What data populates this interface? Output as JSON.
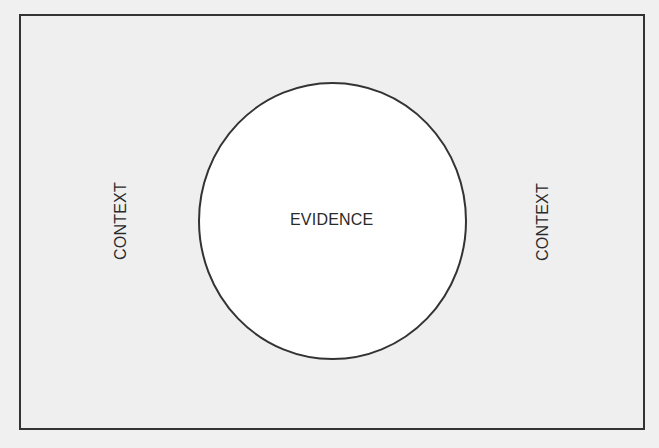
{
  "diagram": {
    "type": "nested-region",
    "frame": {
      "label": "",
      "border_color": "#333333",
      "fill_color": "#efefef"
    },
    "center_shape": {
      "shape": "ellipse",
      "label": "EVIDENCE",
      "fill_color": "#ffffff",
      "stroke_color": "#333333"
    },
    "side_labels": {
      "left": "CONTEXT",
      "right": "CONTEXT"
    }
  }
}
